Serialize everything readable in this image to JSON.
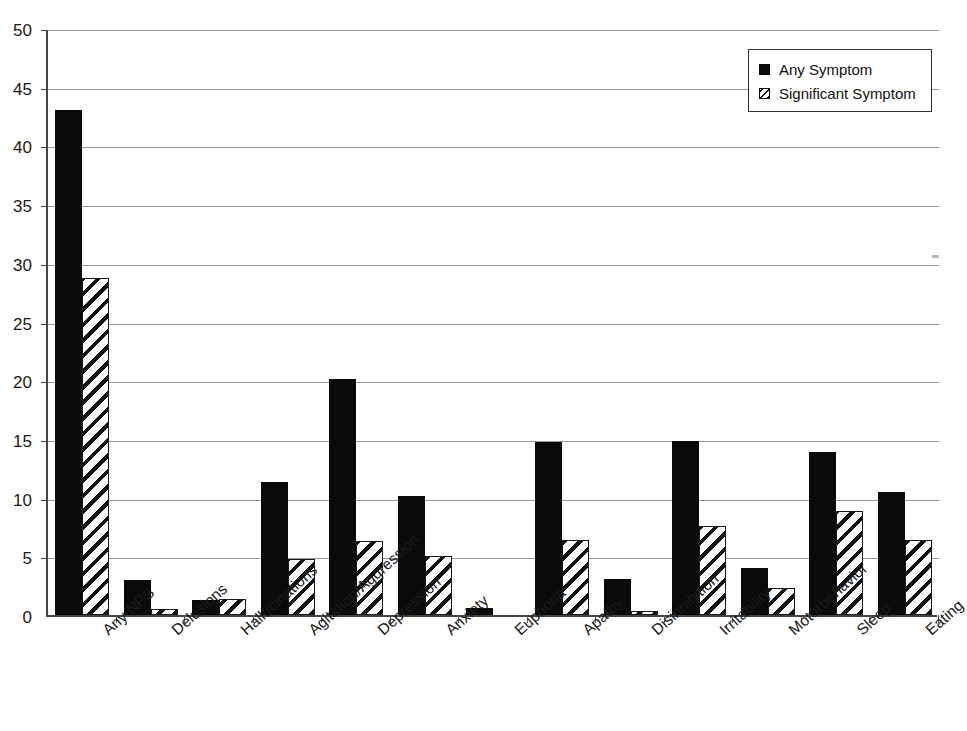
{
  "figure": {
    "title_cut_off": "",
    "background_color": "#ffffff"
  },
  "legend": {
    "position": "top-right",
    "entries": [
      {
        "label": "Any Symptom",
        "pattern": "solid",
        "color": "#0a0a0a"
      },
      {
        "label": "Significant Symptom",
        "pattern": "diagonal-hatch",
        "color": "#ffffff"
      }
    ]
  },
  "axes": {
    "y_ticks": [
      "0",
      "5",
      "10",
      "15",
      "20",
      "25",
      "30",
      "35",
      "40",
      "45",
      "50"
    ],
    "y_min": 0,
    "y_max": 50,
    "y_step": 5,
    "grid": true
  },
  "chart_data": {
    "type": "bar",
    "title": "",
    "xlabel": "",
    "ylabel": "",
    "ylim": [
      0,
      50
    ],
    "grid": true,
    "legend_position": "top-right",
    "categories": [
      "Any NPS",
      "Delusions",
      "Hallucinations",
      "Agitation/Aggression",
      "Depression",
      "Anxiety",
      "Euphoria",
      "Apathy",
      "Disinhibition",
      "Irritability",
      "Motorbehavior",
      "Sleep",
      "Eating"
    ],
    "series": [
      {
        "name": "Any Symptom",
        "pattern": "solid",
        "values": [
          43.0,
          3.0,
          1.3,
          11.3,
          20.1,
          10.1,
          0.6,
          14.7,
          3.1,
          14.8,
          4.0,
          13.9,
          10.5
        ]
      },
      {
        "name": "Significant Symptom",
        "pattern": "diagonal-hatch",
        "values": [
          28.7,
          0.5,
          1.4,
          4.8,
          6.3,
          5.0,
          0.0,
          6.4,
          0.3,
          7.6,
          2.3,
          8.9,
          6.4
        ]
      }
    ]
  }
}
